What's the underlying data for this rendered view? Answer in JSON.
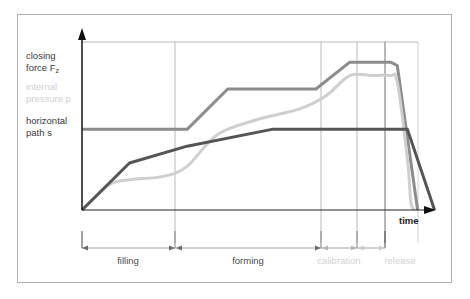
{
  "figure": {
    "background_color": "#ffffff",
    "border_color": "#b0b0b0"
  },
  "legend": {
    "items": [
      {
        "id": "closing-force",
        "line1": "closing",
        "line2": "force F",
        "subscript": "z",
        "color": "#8c8c8c",
        "muted": false
      },
      {
        "id": "internal-pressure",
        "line1": "internal",
        "line2": "pressure p",
        "subscript": "",
        "color": "#cfcfcf",
        "muted": true
      },
      {
        "id": "horizontal-path",
        "line1": "horizontal",
        "line2": "path s",
        "subscript": "",
        "color": "#555555",
        "muted": false
      }
    ]
  },
  "axes": {
    "x_axis_label": "time",
    "arrow_color": "#111111",
    "axis_color": "#222222",
    "grid_color": "#b9b9b9"
  },
  "phases": {
    "labels": [
      {
        "name": "filling",
        "muted": false
      },
      {
        "name": "forming",
        "muted": false
      },
      {
        "name": "calibration",
        "muted": true
      },
      {
        "name": "release",
        "muted": true
      }
    ]
  },
  "chart_data": {
    "type": "line",
    "title": "",
    "xlabel": "time",
    "ylabel": "",
    "grid": true,
    "legend_position": "left",
    "xlim": [
      0,
      100
    ],
    "ylim": [
      0,
      100
    ],
    "x_gridlines": [
      31,
      79,
      91,
      99
    ],
    "y_gridlines": [
      100
    ],
    "phase_boundaries": [
      0,
      31,
      79,
      91,
      99
    ],
    "phase_names": [
      "filling",
      "forming",
      "calibration",
      "release"
    ],
    "series": [
      {
        "name": "closing force Fz",
        "color": "#8c8c8c",
        "width": 3.0,
        "smooth": false,
        "points": [
          [
            0,
            48
          ],
          [
            31,
            48
          ],
          [
            43,
            72
          ],
          [
            61,
            72
          ],
          [
            69,
            72
          ],
          [
            79,
            88
          ],
          [
            91,
            88
          ],
          [
            93,
            86
          ],
          [
            99,
            0
          ]
        ]
      },
      {
        "name": "internal pressure p",
        "color": "#cfcfcf",
        "width": 3.0,
        "smooth": true,
        "points": [
          [
            0,
            0
          ],
          [
            8,
            15
          ],
          [
            14,
            18
          ],
          [
            24,
            20
          ],
          [
            31,
            26
          ],
          [
            40,
            45
          ],
          [
            52,
            54
          ],
          [
            64,
            60
          ],
          [
            72,
            68
          ],
          [
            79,
            80
          ],
          [
            86,
            80
          ],
          [
            91,
            80
          ],
          [
            93,
            76
          ],
          [
            96,
            30
          ],
          [
            97,
            5
          ],
          [
            98,
            0
          ]
        ]
      },
      {
        "name": "horizontal path s",
        "color": "#555555",
        "width": 3.0,
        "smooth": false,
        "points": [
          [
            0,
            0
          ],
          [
            14,
            28
          ],
          [
            31,
            38
          ],
          [
            56,
            48
          ],
          [
            79,
            48
          ],
          [
            91,
            48
          ],
          [
            96,
            48
          ],
          [
            104,
            0
          ]
        ]
      }
    ]
  }
}
